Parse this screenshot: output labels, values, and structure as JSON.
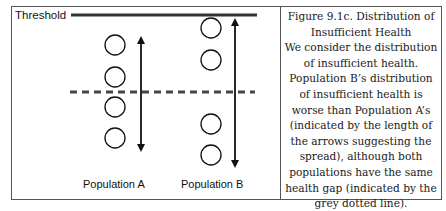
{
  "diagram": {
    "threshold_label": "Threshold",
    "populations": [
      {
        "label": "Population A",
        "circles": 4,
        "arrow": "short spread"
      },
      {
        "label": "Population B",
        "circles": 4,
        "arrow": "long spread"
      }
    ],
    "gap_line": "dashed grey line (health gap)"
  },
  "caption": {
    "title": "Figure 9.1c. Distribution of Insufficient Health",
    "body": "We consider the distribution of insufficient health. Population B’s distribution of insufficient health is worse than Population A’s (indicated by the length of the arrows suggesting the spread), although both populations have the same health gap (indicated by the grey dotted line)."
  }
}
